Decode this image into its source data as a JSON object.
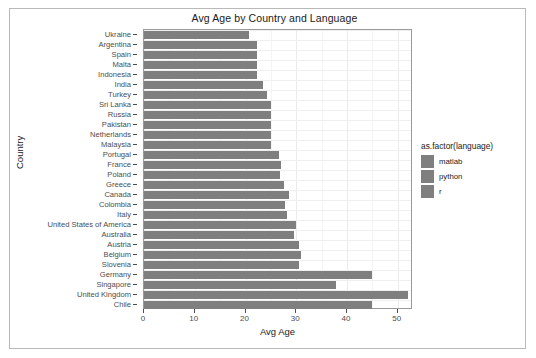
{
  "chart_data": {
    "type": "bar",
    "title": "Avg Age by Country and Language",
    "xlabel": "Avg Age",
    "ylabel": "Country",
    "orientation": "horizontal",
    "xlim": [
      0,
      53
    ],
    "x_ticks": [
      0,
      10,
      20,
      30,
      40,
      50
    ],
    "x_tick_labels": [
      "0",
      "10",
      "20",
      "30",
      "40",
      "50"
    ],
    "grid": true,
    "legend": {
      "title": "as.factor(language)",
      "position": "right",
      "entries": [
        {
          "label": "matlab",
          "color": "#7f7f7f"
        },
        {
          "label": "python",
          "color": "#7f7f7f"
        },
        {
          "label": "r",
          "color": "#7f7f7f"
        }
      ]
    },
    "bar_color": "#7f7f7f",
    "categories": [
      "Ukraine",
      "Argentina",
      "Spain",
      "Malta",
      "Indonesia",
      "India",
      "Turkey",
      "Sri Lanka",
      "Russia",
      "Pakistan",
      "Netherlands",
      "Malaysia",
      "Portugal",
      "France",
      "Poland",
      "Greece",
      "Canada",
      "Colombia",
      "Italy",
      "United States of America",
      "Australia",
      "Austria",
      "Belgium",
      "Slovenia",
      "Germany",
      "Singapore",
      "United Kingdom",
      "Chile"
    ],
    "values": [
      20.6,
      22.3,
      22.3,
      22.3,
      22.3,
      23.5,
      24.2,
      25.0,
      25.0,
      25.0,
      25.0,
      25.0,
      26.5,
      27.0,
      26.8,
      27.5,
      28.5,
      27.7,
      28.2,
      30.0,
      29.5,
      30.5,
      31.0,
      30.5,
      45.0,
      37.8,
      52.0,
      45.0
    ]
  }
}
